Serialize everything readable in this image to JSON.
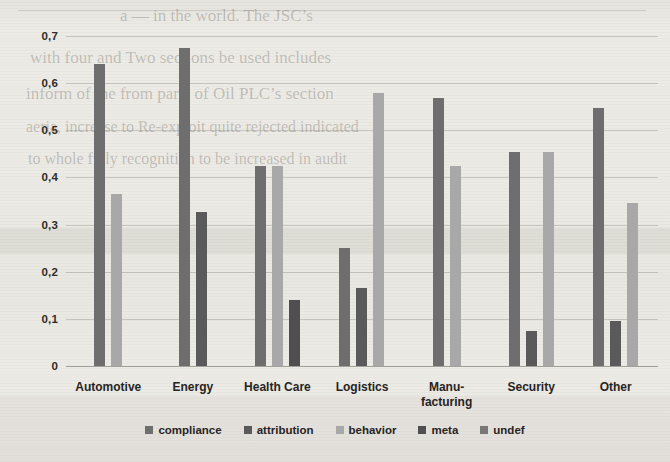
{
  "chart_data": {
    "type": "bar",
    "title": "",
    "subtitle": "",
    "xlabel": "",
    "ylabel": "",
    "ylim": [
      0,
      0.7
    ],
    "ytick_labels": [
      "0",
      "0,1",
      "0,2",
      "0,3",
      "0,4",
      "0,5",
      "0,6",
      "0,7"
    ],
    "ytick_values": [
      0,
      0.1,
      0.2,
      0.3,
      0.4,
      0.5,
      0.6,
      0.7
    ],
    "decimal_separator": ",",
    "grid": true,
    "legend_position": "bottom",
    "categories": [
      "Automotive",
      "Energy",
      "Health Care",
      "Logistics",
      "Manu-facturing",
      "Security",
      "Other"
    ],
    "category_lines": [
      [
        "Automotive"
      ],
      [
        "Energy"
      ],
      [
        "Health Care"
      ],
      [
        "Logistics"
      ],
      [
        "Manu-",
        "facturing"
      ],
      [
        "Security"
      ],
      [
        "Other"
      ]
    ],
    "series": [
      {
        "name": "compliance",
        "color": "#6e6e6e",
        "values": [
          0.64,
          0.675,
          0.425,
          0.25,
          0.568,
          0.455,
          0.548
        ]
      },
      {
        "name": "attribution",
        "color": "#5a5a5a",
        "values": [
          null,
          0.327,
          null,
          0.165,
          null,
          0.075,
          0.095
        ]
      },
      {
        "name": "behavior",
        "color": "#a8a8a8",
        "values": [
          0.365,
          null,
          0.425,
          0.58,
          0.425,
          0.455,
          0.345
        ]
      },
      {
        "name": "meta",
        "color": "#4f4f4f",
        "values": [
          null,
          null,
          0.14,
          null,
          null,
          null,
          null
        ]
      },
      {
        "name": "undef",
        "color": "#787878",
        "values": [
          null,
          null,
          null,
          null,
          null,
          null,
          null
        ]
      }
    ]
  },
  "legend": {
    "items": [
      {
        "label": "compliance",
        "color": "#6e6e6e"
      },
      {
        "label": "attribution",
        "color": "#5a5a5a"
      },
      {
        "label": "behavior",
        "color": "#a8a8a8"
      },
      {
        "label": "meta",
        "color": "#4f4f4f"
      },
      {
        "label": "undef",
        "color": "#787878"
      }
    ]
  },
  "background": {
    "page_tint": "#e9e7e2",
    "ghost_lines": [
      {
        "text": "a — in the world. The JSC’s",
        "x": 120,
        "y": 6,
        "size": 17
      },
      {
        "text": "with  four  and  Two  sections  be  used  includes",
        "x": 30,
        "y": 48,
        "size": 17
      },
      {
        "text": "inform   of   the   from   parts   of   Oil   PLC’s   section",
        "x": 26,
        "y": 84,
        "size": 17
      },
      {
        "text": "aeria,  increase  to  Re-exploit  quite  rejected  indicated",
        "x": 26,
        "y": 118,
        "size": 16
      },
      {
        "text": "to whole fully recognition to be increased in audit",
        "x": 28,
        "y": 150,
        "size": 16
      }
    ]
  }
}
